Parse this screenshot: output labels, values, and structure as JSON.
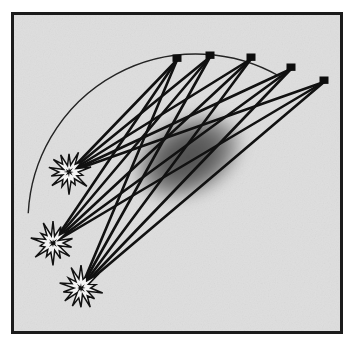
{
  "figure": {
    "canvas": {
      "width": 353,
      "height": 347
    },
    "colors": {
      "page_background": "#ffffff",
      "panel_background": "#dedede",
      "frame_stroke": "#1b1b1b",
      "ray_stroke": "#111111",
      "arc_stroke": "#242424",
      "receiver_fill": "#0d0d0d",
      "source_outline": "#111111",
      "source_fill": "#f4f4f4",
      "anomaly_core": "#555555",
      "anomaly_mid": "#7d7d7d",
      "anomaly_edge": "#a9a9a9"
    },
    "frame": {
      "x": 11,
      "y": 12,
      "width": 332,
      "height": 322,
      "stroke_width": 3
    },
    "arc": {
      "center_x": 196,
      "center_y": 222,
      "radius": 168,
      "start_angle_deg": 183,
      "end_angle_deg": 300,
      "stroke_width": 1.4
    }
  },
  "receivers": {
    "label": "receiver-stations",
    "count": 5,
    "marker_size": 9,
    "items": [
      {
        "name": "receiver-1",
        "x": 177,
        "y": 60
      },
      {
        "name": "receiver-2",
        "x": 210,
        "y": 57
      },
      {
        "name": "receiver-3",
        "x": 251,
        "y": 59
      },
      {
        "name": "receiver-4",
        "x": 291,
        "y": 69
      },
      {
        "name": "receiver-5",
        "x": 324,
        "y": 82
      }
    ]
  },
  "sources": {
    "label": "explosive-sources",
    "count": 3,
    "star_points": 14,
    "outer_radius": 18,
    "inner_radius": 8,
    "items": [
      {
        "name": "source-1",
        "x": 69,
        "y": 172
      },
      {
        "name": "source-2",
        "x": 53,
        "y": 243
      },
      {
        "name": "source-3",
        "x": 81,
        "y": 288
      }
    ]
  },
  "rays": {
    "label": "ray-paths",
    "count": 15,
    "stroke_width": 2.6,
    "pairs": [
      [
        0,
        0
      ],
      [
        0,
        1
      ],
      [
        0,
        2
      ],
      [
        0,
        3
      ],
      [
        0,
        4
      ],
      [
        1,
        0
      ],
      [
        1,
        1
      ],
      [
        1,
        2
      ],
      [
        1,
        3
      ],
      [
        1,
        4
      ],
      [
        2,
        0
      ],
      [
        2,
        1
      ],
      [
        2,
        2
      ],
      [
        2,
        3
      ],
      [
        2,
        4
      ]
    ]
  },
  "anomaly": {
    "label": "low-velocity-anomaly",
    "center_x": 188,
    "center_y": 157,
    "radius_x": 62,
    "radius_y": 42,
    "rotation_deg": -27,
    "blur": 9
  }
}
